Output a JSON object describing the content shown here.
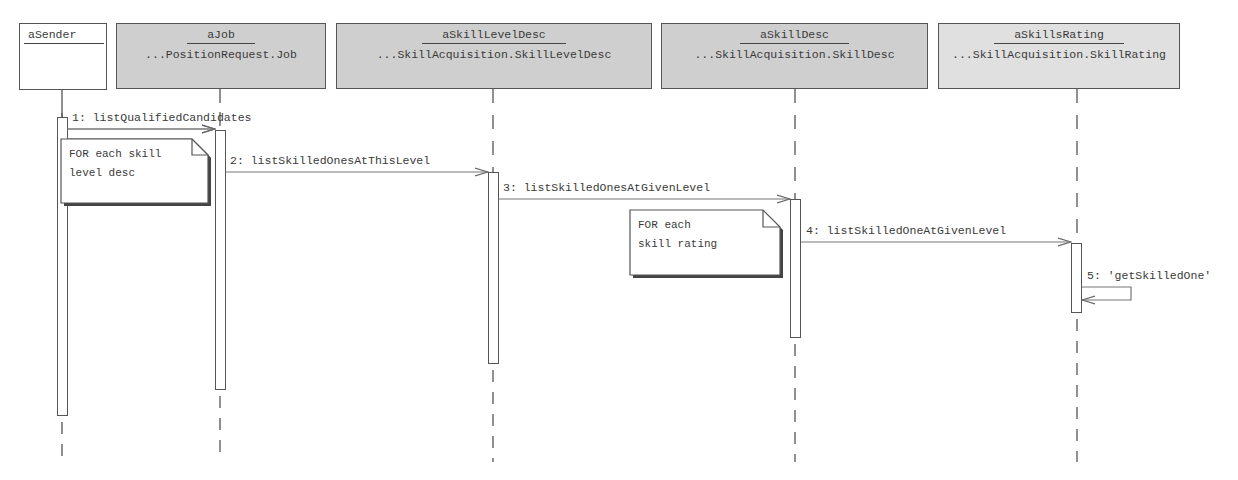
{
  "diagram": {
    "type": "UML sequence diagram",
    "objects": [
      {
        "id": "aSender",
        "name": "aSender",
        "class": ""
      },
      {
        "id": "aJob",
        "name": "aJob",
        "class": "...PositionRequest.Job"
      },
      {
        "id": "aSkillLevelDesc",
        "name": "aSkillLevelDesc",
        "class": "...SkillAcquisition.SkillLevelDesc"
      },
      {
        "id": "aSkillDesc",
        "name": "aSkillDesc",
        "class": "...SkillAcquisition.SkillDesc"
      },
      {
        "id": "aSkillsRating",
        "name": "aSkillsRating",
        "class": "...SkillAcquisition.SkillRating"
      }
    ],
    "messages": [
      {
        "label": "1: listQualifiedCandidates",
        "from": "aSender",
        "to": "aJob"
      },
      {
        "label": "2: listSkilledOnesAtThisLevel",
        "from": "aJob",
        "to": "aSkillLevelDesc"
      },
      {
        "label": "3: listSkilledOnesAtGivenLevel",
        "from": "aSkillLevelDesc",
        "to": "aSkillDesc"
      },
      {
        "label": "4: listSkilledOneAtGivenLevel",
        "from": "aSkillDesc",
        "to": "aSkillsRating"
      },
      {
        "label": "5: 'getSkilledOne'",
        "from": "aSkillsRating",
        "to": "aSkillsRating"
      }
    ],
    "notes": [
      {
        "text": "FOR each skill\nlevel desc"
      },
      {
        "text": "FOR each\nskill rating"
      }
    ]
  }
}
